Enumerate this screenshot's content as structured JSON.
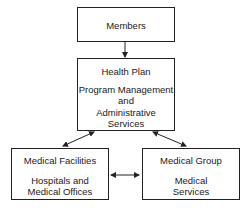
{
  "diagram": {
    "nodes": {
      "members": {
        "title": "Members"
      },
      "health_plan": {
        "title": "Health Plan",
        "subtitle": "Program Management\nand\nAdministrative\nServices"
      },
      "medical_facilities": {
        "title": "Medical Facilities",
        "subtitle": "Hospitals and\nMedical Offices"
      },
      "medical_group": {
        "title": "Medical Group",
        "subtitle": "Medical\nServices"
      }
    },
    "edges": [
      {
        "from": "members",
        "to": "health_plan",
        "direction": "one-way"
      },
      {
        "from": "health_plan",
        "to": "medical_facilities",
        "direction": "two-way"
      },
      {
        "from": "health_plan",
        "to": "medical_group",
        "direction": "two-way"
      },
      {
        "from": "medical_facilities",
        "to": "medical_group",
        "direction": "two-way"
      }
    ]
  }
}
